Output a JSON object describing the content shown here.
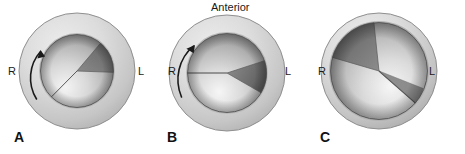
{
  "figure": {
    "width": 465,
    "height": 154,
    "background_color": "#ffffff"
  },
  "annotations": {
    "anterior_label": "Anterior"
  },
  "colors": {
    "outer_ring_light": "#e3e3e3",
    "outer_ring_mid": "#cccccc",
    "outer_ring_dark": "#a8a8a8",
    "outer_ring_outline": "#8f8f8f",
    "sphere_highlight": "#f2f2f2",
    "sphere_mid": "#c4c4c4",
    "sphere_dark": "#8a8a8a",
    "sphere_outline": "#6e6e6e",
    "wedge_dark": "#6f6f6f",
    "wedge_darker": "#5c5c5c",
    "divider_line": "#4a4a4a",
    "text": "#1a1a1a",
    "letter": "#111111",
    "arrow": "#1a1a1a"
  },
  "panels": [
    {
      "id": "a",
      "letter": "A",
      "left_label": "R",
      "right_label": "L",
      "has_arrow": true,
      "arrow_direction": "counterclockwise",
      "wedge_position": "upper-right",
      "wedge_start_deg": 310,
      "wedge_end_deg": 358
    },
    {
      "id": "b",
      "letter": "B",
      "left_label": "R",
      "right_label": "L",
      "has_arrow": true,
      "arrow_direction": "counterclockwise",
      "wedge_position": "right",
      "wedge_start_deg": 342,
      "wedge_end_deg": 30
    },
    {
      "id": "c",
      "letter": "C",
      "left_label": "R",
      "right_label": "L",
      "has_arrow": false,
      "arrow_direction": "",
      "wedge_position": "upper-left",
      "wedge_start_deg": 196,
      "wedge_end_deg": 264
    }
  ]
}
